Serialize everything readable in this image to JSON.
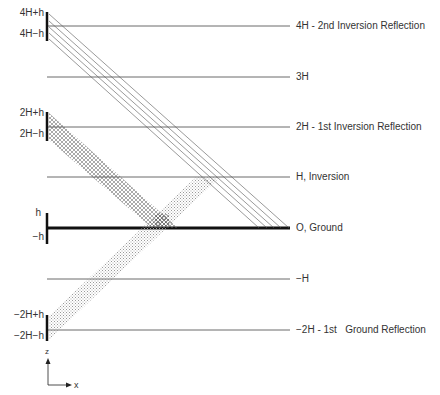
{
  "levels": [
    {
      "id": "4H",
      "label": "4H - 2nd Inversion Reflection"
    },
    {
      "id": "3H",
      "label": "3H"
    },
    {
      "id": "2H",
      "label": "2H - 1st Inversion Reflection"
    },
    {
      "id": "H",
      "label": "H, Inversion"
    },
    {
      "id": "O",
      "label": "O, Ground"
    },
    {
      "id": "-H",
      "label": "−H"
    },
    {
      "id": "-2H",
      "label": "−2H - 1st   Ground Reflection"
    }
  ],
  "source_labels": {
    "s4_top": "4H+h",
    "s4_bot": "4H−h",
    "s2_top": "2H+h",
    "s2_bot": "2H−h",
    "s0_top": "h",
    "s0_bot": "−h",
    "sm2_top": "−2H+h",
    "sm2_bot": "−2H−h"
  },
  "axes": {
    "z_label": "z",
    "x_label": "x"
  },
  "caption": ""
}
